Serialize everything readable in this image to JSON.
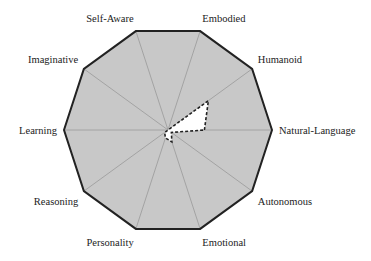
{
  "chart_data": {
    "type": "radar",
    "title": "",
    "axes": [
      "Natural-Language",
      "Humanoid",
      "Embodied",
      "Self-Aware",
      "Imaginative",
      "Learning",
      "Reasoning",
      "Personality",
      "Emotional",
      "Autonomous"
    ],
    "series": [
      {
        "name": "profile",
        "style": "dashed",
        "values": [
          0.35,
          0.48,
          0.0,
          0.0,
          0.0,
          0.0,
          0.04,
          0.08,
          0.12,
          0.04
        ]
      }
    ],
    "range": [
      0,
      1
    ],
    "grid": "spokes",
    "fill": "#c8c8c8"
  }
}
